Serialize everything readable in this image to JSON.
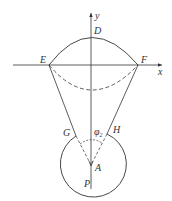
{
  "diagram": {
    "axes": {
      "x_label": "x",
      "y_label": "y"
    },
    "points": {
      "D": "D",
      "E": "E",
      "F": "F",
      "G": "G",
      "H": "H",
      "A": "A",
      "P": "P"
    },
    "angle": {
      "symbol": "φ",
      "subscript": "2"
    },
    "colors": {
      "stroke": "#333333",
      "background": "#ffffff"
    }
  }
}
